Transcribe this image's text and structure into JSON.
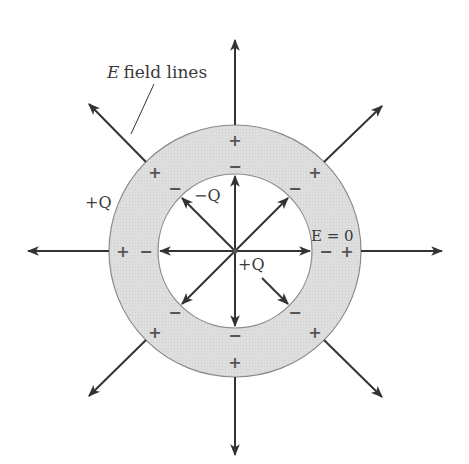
{
  "diagram": {
    "title_label": "field lines",
    "title_label_italic": "E",
    "outer_charge_label": "+Q",
    "inner_surface_charge_label": "−Q",
    "center_charge_label": "+Q",
    "inside_conductor_label": "E = 0",
    "plus_sign": "+",
    "minus_sign": "−"
  },
  "geometry": {
    "center": [
      235,
      251
    ],
    "inner_radius": 77,
    "outer_radius": 126
  },
  "colors": {
    "shell_fill": "#dcdcdc",
    "shell_stroke": "#8a8a8a",
    "arrow": "#333333",
    "sign": "#555555"
  }
}
